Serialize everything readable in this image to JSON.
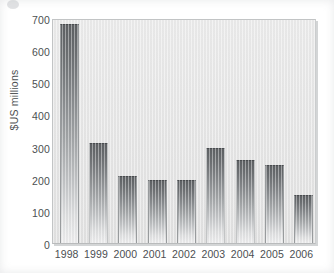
{
  "chart_data": {
    "type": "bar",
    "title": "",
    "xlabel": "",
    "ylabel": "$US millions",
    "categories": [
      "1998",
      "1999",
      "2000",
      "2001",
      "2002",
      "2003",
      "2004",
      "2005",
      "2006"
    ],
    "values": [
      680,
      310,
      210,
      197,
      195,
      295,
      257,
      243,
      150
    ],
    "yticks": [
      0,
      100,
      200,
      300,
      400,
      500,
      600,
      700
    ],
    "ytick_labels": [
      "0",
      "100",
      "200",
      "300",
      "400",
      "500",
      "600",
      "700"
    ],
    "ylim": [
      0,
      700
    ],
    "grid": false,
    "legend": false,
    "series": [
      {
        "name": "$US millions",
        "values": [
          680,
          310,
          210,
          197,
          195,
          295,
          257,
          243,
          150
        ]
      }
    ],
    "bar_fill": "gradient-dark-top-to-light-bottom",
    "colors": {
      "bar_top": "#5e6164",
      "bar_bottom": "#ededee",
      "plot_background": "#e8e8e8",
      "page_background": "#ffffff",
      "text": "#4c4f52",
      "frame": "#c2c4c5"
    }
  }
}
